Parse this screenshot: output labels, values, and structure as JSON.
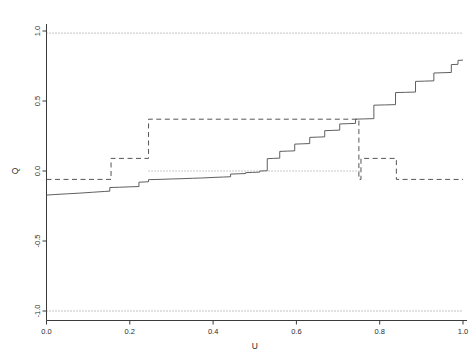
{
  "chart_data": {
    "type": "line",
    "title": "",
    "subtitle": "",
    "xlabel": "U",
    "ylabel": "Q",
    "xlim": [
      0.0,
      1.0
    ],
    "ylim": [
      -1.0,
      1.0
    ],
    "grid": false,
    "legend_position": "none",
    "xticks": [
      0.0,
      0.2,
      0.4,
      0.6,
      0.8,
      1.0
    ],
    "xticklabels": [
      "0.0",
      "0.2",
      "0.4",
      "0.6",
      "0.8",
      "1.0"
    ],
    "yticks": [
      -1.0,
      -0.5,
      0.0,
      0.5,
      1.0
    ],
    "yticklabels": [
      "-1.0",
      "-0.5",
      "0.0",
      "0.5",
      "1.0"
    ],
    "annotations": [],
    "series": [
      {
        "name": "empirical-quantile-step-curve",
        "style": "solid",
        "color": "#4d4d4d",
        "linewidth": 0.9,
        "x": [
          0.0,
          0.02,
          0.05,
          0.08,
          0.11,
          0.14,
          0.152,
          0.152,
          0.175,
          0.2,
          0.222,
          0.222,
          0.245,
          0.245,
          0.27,
          0.3,
          0.325,
          0.35,
          0.372,
          0.372,
          0.4,
          0.425,
          0.442,
          0.442,
          0.462,
          0.462,
          0.478,
          0.478,
          0.495,
          0.495,
          0.512,
          0.512,
          0.53,
          0.53,
          0.545,
          0.545,
          0.56,
          0.56,
          0.578,
          0.578,
          0.596,
          0.596,
          0.614,
          0.614,
          0.632,
          0.632,
          0.65,
          0.65,
          0.668,
          0.668,
          0.686,
          0.686,
          0.704,
          0.704,
          0.722,
          0.722,
          0.742,
          0.742,
          0.762,
          0.762,
          0.786,
          0.786,
          0.812,
          0.812,
          0.838,
          0.838,
          0.862,
          0.862,
          0.886,
          0.886,
          0.908,
          0.908,
          0.93,
          0.93,
          0.952,
          0.952,
          0.972,
          0.972,
          0.988,
          0.988,
          1.0
        ],
        "y": [
          -0.172,
          -0.168,
          -0.163,
          -0.158,
          -0.152,
          -0.146,
          -0.144,
          -0.118,
          -0.116,
          -0.113,
          -0.111,
          -0.08,
          -0.077,
          -0.062,
          -0.06,
          -0.057,
          -0.055,
          -0.052,
          -0.05,
          -0.05,
          -0.046,
          -0.043,
          -0.041,
          -0.022,
          -0.02,
          -0.02,
          -0.018,
          -0.012,
          -0.01,
          -0.01,
          -0.008,
          0.0,
          0.002,
          0.088,
          0.09,
          0.09,
          0.092,
          0.14,
          0.142,
          0.142,
          0.144,
          0.192,
          0.194,
          0.194,
          0.196,
          0.24,
          0.242,
          0.242,
          0.244,
          0.288,
          0.29,
          0.29,
          0.292,
          0.336,
          0.338,
          0.338,
          0.34,
          0.37,
          0.372,
          0.372,
          0.374,
          0.47,
          0.472,
          0.472,
          0.474,
          0.56,
          0.562,
          0.562,
          0.564,
          0.64,
          0.642,
          0.642,
          0.644,
          0.7,
          0.702,
          0.702,
          0.704,
          0.76,
          0.762,
          0.79,
          0.792
        ]
      },
      {
        "name": "fitted-quantile-step-dashed",
        "style": "dashed",
        "color": "#555555",
        "linewidth": 1.0,
        "x": [
          0.0,
          0.155,
          0.155,
          0.245,
          0.245,
          0.75,
          0.75,
          0.755,
          0.755,
          0.84,
          0.84,
          1.0
        ],
        "y": [
          -0.06,
          -0.06,
          0.09,
          0.09,
          0.37,
          0.37,
          -0.06,
          -0.06,
          0.09,
          0.09,
          -0.06,
          -0.06
        ]
      },
      {
        "name": "upper-reference-dotted",
        "style": "dotted",
        "color": "#7a7a7a",
        "linewidth": 0.9,
        "x": [
          0.0,
          1.0
        ],
        "y": [
          0.985,
          0.985
        ]
      },
      {
        "name": "zero-reference-dotted",
        "style": "dotted",
        "color": "#8a8a8a",
        "linewidth": 0.9,
        "x": [
          0.245,
          0.755
        ],
        "y": [
          0.0,
          0.0
        ]
      },
      {
        "name": "lower-reference-dotted",
        "style": "dotted",
        "color": "#7a7a7a",
        "linewidth": 0.9,
        "x": [
          0.0,
          1.0
        ],
        "y": [
          -1.0,
          -1.0
        ]
      }
    ]
  },
  "axes": {
    "x_title": "U",
    "y_title": "Q"
  }
}
